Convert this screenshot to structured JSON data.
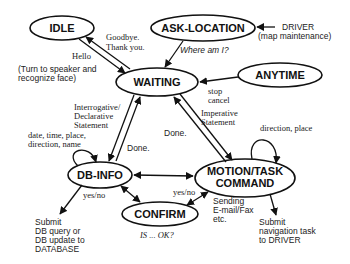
{
  "nodes": {
    "idle": "IDLE",
    "ask_location": "ASK-LOCATION",
    "waiting": "WAITING",
    "anytime": "ANYTIME",
    "db_info": "DB-INFO",
    "motion_line1": "MOTION/TASK",
    "motion_line2": "COMMAND",
    "confirm": "CONFIRM"
  },
  "labels": {
    "goodbye_line1": "Goodbye.",
    "goodbye_line2": "Thank you.",
    "hello": "Hello",
    "turn_line1": "(Turn to speaker and",
    "turn_line2": "recognize face)",
    "driver_line1": "DRIVER",
    "driver_line2": "(map maintenance)",
    "where_am_i": "Where am I?",
    "stop": "stop",
    "cancel": "cancel",
    "interrogative_line1": "Interrogative/",
    "interrogative_line2": "Declarative",
    "interrogative_line3": "Statement",
    "done_left": "Done.",
    "done_right": "Done.",
    "imperative_line1": "Imperative",
    "imperative_line2": "Statement",
    "db_loop_line1": "date, time, place,",
    "db_loop_line2": "direction, name",
    "motion_loop": "direction, place",
    "yesno_left": "yes/no",
    "yesno_right": "yes/no",
    "submit_db_line1": "Submit",
    "submit_db_line2": "DB query or",
    "submit_db_line3": "DB update to",
    "submit_db_line4": "DATABASE",
    "sending_line1": "Sending",
    "sending_line2": "E-mail/Fax",
    "sending_line3": "etc.",
    "submit_nav_line1": "Submit",
    "submit_nav_line2": "navigation task",
    "submit_nav_line3": "to DRIVER",
    "is_ok": "IS ... OK?"
  }
}
